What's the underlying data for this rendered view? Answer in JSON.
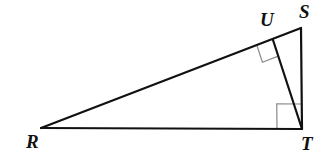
{
  "figure": {
    "kind": "geometry-diagram",
    "background_color": "#ffffff",
    "stroke_color": "#111111",
    "mark_color": "#8a8a8a",
    "stroke_width": 2.2,
    "mark_stroke_width": 1.2,
    "width": 331,
    "height": 161
  },
  "points": [
    {
      "name": "R",
      "label": "R",
      "x": 41,
      "y": 128,
      "label_x": 26,
      "label_y": 132
    },
    {
      "name": "U",
      "label": "U",
      "x": 273,
      "y": 40,
      "label_x": 260,
      "label_y": 10
    },
    {
      "name": "S",
      "label": "S",
      "x": 301,
      "y": 28,
      "label_x": 299,
      "label_y": 2
    },
    {
      "name": "T",
      "label": "T",
      "x": 302,
      "y": 129,
      "label_x": 301,
      "label_y": 134
    }
  ],
  "segments": [
    {
      "name": "RS",
      "from": "R",
      "to": "S",
      "role": "hypotenuse"
    },
    {
      "name": "RT",
      "from": "R",
      "to": "T",
      "role": "leg-base"
    },
    {
      "name": "ST",
      "from": "S",
      "to": "T",
      "role": "leg-vertical"
    },
    {
      "name": "TU",
      "from": "T",
      "to": "U",
      "role": "altitude"
    }
  ],
  "right_angles": [
    {
      "name": "right-angle-at-U",
      "at": "U",
      "size": 17,
      "rotation_deg": -21,
      "note": "altitude TU perpendicular to RS"
    },
    {
      "name": "right-angle-at-T",
      "at": "T",
      "size": 25,
      "rotation_deg": 0,
      "note": "angle RTS is a right angle"
    }
  ]
}
